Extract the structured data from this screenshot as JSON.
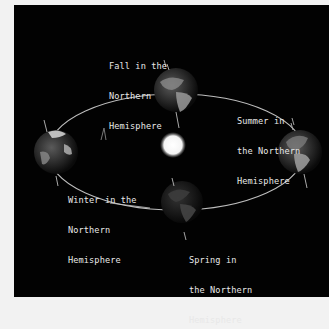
{
  "diagram": {
    "type": "earth-orbit-seasons",
    "background_color": "#020202",
    "text_color": "#e8e8e8",
    "center_object": {
      "name": "Sun",
      "color": "#ffffff"
    },
    "orbit": {
      "shape": "ellipse",
      "color": "#bbbbbb"
    },
    "positions": [
      {
        "id": "fall",
        "lines": [
          "Fall in the",
          "Northern",
          "Hemisphere"
        ]
      },
      {
        "id": "summer",
        "lines": [
          "Summer in",
          "the Northern",
          "Hemisphere"
        ]
      },
      {
        "id": "winter",
        "lines": [
          "Winter in the",
          "Northern",
          "Hemisphere"
        ]
      },
      {
        "id": "spring",
        "lines": [
          "Spring in",
          "the Northern",
          "Hemisphere"
        ]
      }
    ]
  }
}
